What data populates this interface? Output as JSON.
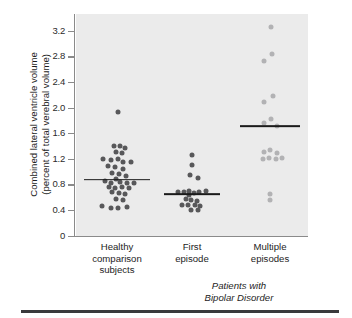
{
  "axis": {
    "y_title_line1": "Combined lateral ventricle volume",
    "y_title_line2": "(percent of total verebral volume)",
    "y_ticks": [
      "3.2",
      "2.8",
      "2.4",
      "2.0",
      "1.6",
      "1.2",
      "0.8",
      "0.4",
      "0"
    ],
    "group_note_line1": "Patients with",
    "group_note_line2": "Bipolar Disorder"
  },
  "categories": [
    {
      "line1": "Healthy",
      "line2": "comparison",
      "line3": "subjects"
    },
    {
      "line1": "First",
      "line2": "episode",
      "line3": ""
    },
    {
      "line1": "Multiple",
      "line2": "episodes",
      "line3": ""
    }
  ],
  "colors": {
    "panel_background": "#ebebeb",
    "dot_dark": "#58585a",
    "dot_light": "#b2b2b4",
    "median_line": "#1a1a1a",
    "axis_line": "#8a8a8a",
    "bottom_rule": "#3a3a3c"
  },
  "chart_data": {
    "type": "scatter",
    "title": "",
    "xlabel": "",
    "ylabel": "Combined lateral ventricle volume (percent of total verebral volume)",
    "ylim": [
      0,
      3.45
    ],
    "yticks": [
      0,
      0.4,
      0.8,
      1.2,
      1.6,
      2.0,
      2.4,
      2.8,
      3.2
    ],
    "grid": false,
    "legend": "none",
    "categories": [
      "Healthy comparison subjects",
      "First episode",
      "Multiple episodes"
    ],
    "series": [
      {
        "name": "Healthy comparison subjects",
        "color": "#58585a",
        "median": 0.88,
        "n": 36,
        "points": [
          {
            "jitter": 0.02,
            "value": 1.94
          },
          {
            "jitter": -0.06,
            "value": 1.41
          },
          {
            "jitter": 0.06,
            "value": 1.41
          },
          {
            "jitter": 0.18,
            "value": 1.38
          },
          {
            "jitter": -0.02,
            "value": 1.31
          },
          {
            "jitter": 0.1,
            "value": 1.3
          },
          {
            "jitter": -0.3,
            "value": 1.2
          },
          {
            "jitter": -0.12,
            "value": 1.19
          },
          {
            "jitter": 0.02,
            "value": 1.2
          },
          {
            "jitter": 0.14,
            "value": 1.16
          },
          {
            "jitter": 0.3,
            "value": 1.16
          },
          {
            "jitter": -0.2,
            "value": 1.09
          },
          {
            "jitter": -0.04,
            "value": 1.08
          },
          {
            "jitter": 0.12,
            "value": 1.05
          },
          {
            "jitter": -0.1,
            "value": 0.99
          },
          {
            "jitter": 0.04,
            "value": 0.97
          },
          {
            "jitter": 0.2,
            "value": 0.94
          },
          {
            "jitter": -0.02,
            "value": 0.89
          },
          {
            "jitter": -0.26,
            "value": 0.86
          },
          {
            "jitter": -0.12,
            "value": 0.83
          },
          {
            "jitter": 0.06,
            "value": 0.84
          },
          {
            "jitter": 0.22,
            "value": 0.83
          },
          {
            "jitter": 0.36,
            "value": 0.83
          },
          {
            "jitter": -0.18,
            "value": 0.77
          },
          {
            "jitter": -0.04,
            "value": 0.75
          },
          {
            "jitter": 0.1,
            "value": 0.76
          },
          {
            "jitter": 0.26,
            "value": 0.75
          },
          {
            "jitter": -0.1,
            "value": 0.68
          },
          {
            "jitter": 0.04,
            "value": 0.67
          },
          {
            "jitter": 0.18,
            "value": 0.66
          },
          {
            "jitter": -0.02,
            "value": 0.58
          },
          {
            "jitter": 0.12,
            "value": 0.57
          },
          {
            "jitter": -0.32,
            "value": 0.47
          },
          {
            "jitter": -0.14,
            "value": 0.44
          },
          {
            "jitter": 0.02,
            "value": 0.44
          },
          {
            "jitter": 0.22,
            "value": 0.46
          }
        ]
      },
      {
        "name": "First episode",
        "color": "#58585a",
        "median": 0.65,
        "n": 20,
        "points": [
          {
            "jitter": 0.0,
            "value": 1.26
          },
          {
            "jitter": 0.0,
            "value": 1.11
          },
          {
            "jitter": -0.04,
            "value": 0.96
          },
          {
            "jitter": 0.12,
            "value": 0.91
          },
          {
            "jitter": -0.3,
            "value": 0.69
          },
          {
            "jitter": -0.18,
            "value": 0.69
          },
          {
            "jitter": -0.06,
            "value": 0.71
          },
          {
            "jitter": -0.06,
            "value": 0.64
          },
          {
            "jitter": 0.04,
            "value": 0.67
          },
          {
            "jitter": 0.16,
            "value": 0.69
          },
          {
            "jitter": 0.3,
            "value": 0.7
          },
          {
            "jitter": -0.14,
            "value": 0.58
          },
          {
            "jitter": -0.02,
            "value": 0.57
          },
          {
            "jitter": 0.1,
            "value": 0.55
          },
          {
            "jitter": -0.22,
            "value": 0.49
          },
          {
            "jitter": -0.08,
            "value": 0.48
          },
          {
            "jitter": 0.06,
            "value": 0.49
          },
          {
            "jitter": 0.18,
            "value": 0.47
          },
          {
            "jitter": -0.02,
            "value": 0.4
          },
          {
            "jitter": 0.12,
            "value": 0.4
          }
        ]
      },
      {
        "name": "Multiple episodes",
        "color": "#b2b2b4",
        "median": 1.72,
        "n": 17,
        "points": [
          {
            "jitter": 0.02,
            "value": 3.26
          },
          {
            "jitter": 0.04,
            "value": 2.84
          },
          {
            "jitter": -0.12,
            "value": 2.74
          },
          {
            "jitter": 0.06,
            "value": 2.18
          },
          {
            "jitter": -0.12,
            "value": 2.09
          },
          {
            "jitter": 0.02,
            "value": 1.83
          },
          {
            "jitter": -0.14,
            "value": 1.76
          },
          {
            "jitter": 0.16,
            "value": 1.72
          },
          {
            "jitter": -0.14,
            "value": 1.32
          },
          {
            "jitter": 0.0,
            "value": 1.34
          },
          {
            "jitter": 0.16,
            "value": 1.3
          },
          {
            "jitter": -0.16,
            "value": 1.21
          },
          {
            "jitter": -0.02,
            "value": 1.22
          },
          {
            "jitter": 0.12,
            "value": 1.21
          },
          {
            "jitter": 0.26,
            "value": 1.22
          },
          {
            "jitter": 0.0,
            "value": 0.66
          },
          {
            "jitter": 0.0,
            "value": 0.56
          }
        ]
      }
    ]
  }
}
